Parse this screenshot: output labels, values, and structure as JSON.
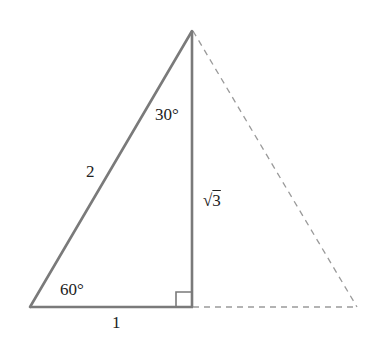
{
  "diagram": {
    "type": "geometry",
    "vertices": {
      "apex": [
        192,
        31
      ],
      "bottom_left": [
        30,
        307
      ],
      "right_angle_foot": [
        193,
        307
      ],
      "dashed_right": [
        357,
        307
      ]
    },
    "labels": {
      "hypotenuse": "2",
      "base": "1",
      "height_radical": "3",
      "height_symbol": "√",
      "angle_top": "30°",
      "angle_bottom_left": "60°"
    },
    "colors": {
      "solid_line": "#7a7a7a",
      "dashed_line": "#9a9a9a",
      "text": "#222222"
    }
  }
}
